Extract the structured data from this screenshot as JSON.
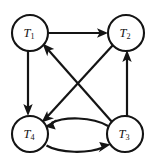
{
  "diagram": {
    "type": "directed-graph",
    "title": "",
    "background_color": "#ffffff",
    "stroke_color": "#141414",
    "node_fill_color": "#ffffff",
    "nodes": [
      {
        "id": "T1",
        "base": "T",
        "subscript": "1",
        "label": "T1",
        "cx": 30,
        "cy": 33,
        "r": 18
      },
      {
        "id": "T2",
        "base": "T",
        "subscript": "2",
        "label": "T2",
        "cx": 126,
        "cy": 33,
        "r": 18
      },
      {
        "id": "T3",
        "base": "T",
        "subscript": "3",
        "label": "T3",
        "cx": 125,
        "cy": 134,
        "r": 18
      },
      {
        "id": "T4",
        "base": "T",
        "subscript": "4",
        "label": "T4",
        "cx": 30,
        "cy": 134,
        "r": 18
      }
    ],
    "edges": [
      {
        "id": "e-t1-t2",
        "from": "T1",
        "to": "T2",
        "label": "",
        "shape": "straight",
        "directed": true
      },
      {
        "id": "e-t1-t4",
        "from": "T1",
        "to": "T4",
        "label": "",
        "shape": "straight",
        "directed": true
      },
      {
        "id": "e-t3-t1",
        "from": "T3",
        "to": "T1",
        "label": "",
        "shape": "straight",
        "directed": true
      },
      {
        "id": "e-t2-t4",
        "from": "T2",
        "to": "T4",
        "label": "",
        "shape": "straight",
        "directed": true
      },
      {
        "id": "e-t3-t2",
        "from": "T3",
        "to": "T2",
        "label": "",
        "shape": "straight",
        "directed": true
      },
      {
        "id": "e-t3-t4",
        "from": "T3",
        "to": "T4",
        "label": "",
        "shape": "curved-upper",
        "directed": true
      },
      {
        "id": "e-t4-t3",
        "from": "T4",
        "to": "T3",
        "label": "",
        "shape": "curved-lower",
        "directed": true
      }
    ]
  }
}
